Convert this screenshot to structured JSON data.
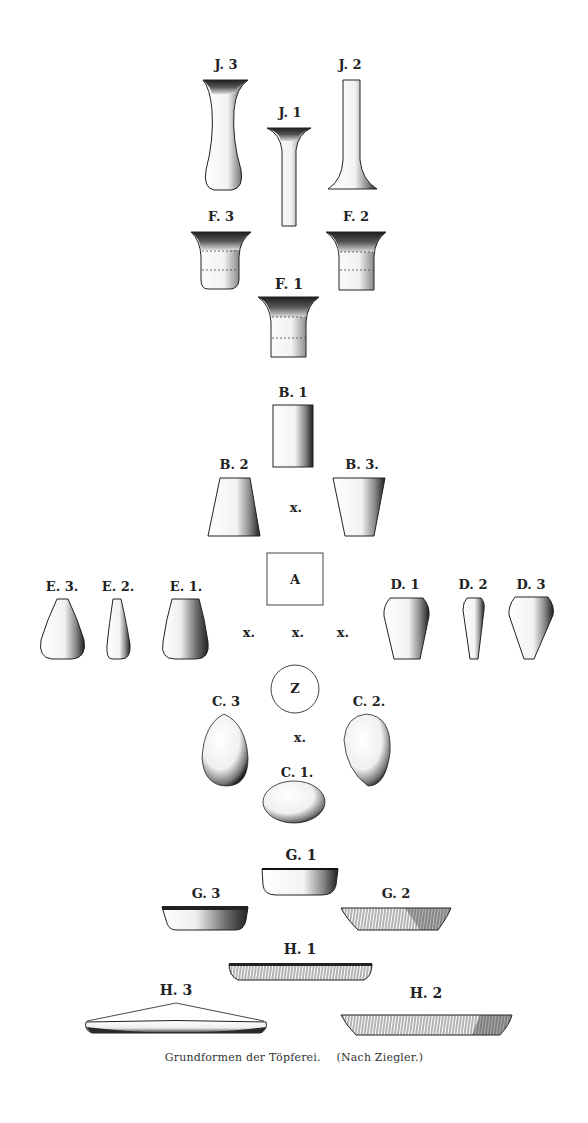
{
  "figure": {
    "caption_title": "Grundformen der Töpferei.",
    "caption_source": "(Nach Ziegler.)",
    "colors": {
      "ink": "#1e1e1e",
      "paper": "#ffffff",
      "shade": "#3a3a3a"
    }
  },
  "labels": {
    "J3": "J. 3",
    "J2": "J. 2",
    "J1": "J. 1",
    "F3": "F. 3",
    "F2": "F. 2",
    "F1": "F. 1",
    "B1": "B. 1",
    "B2": "B. 2",
    "B3": "B. 3.",
    "A": "A",
    "E3": "E. 3.",
    "E2": "E. 2.",
    "E1": "E. 1.",
    "D1": "D. 1",
    "D2": "D. 2",
    "D3": "D. 3",
    "Z": "Z",
    "C3": "C. 3",
    "C2": "C. 2.",
    "C1": "C. 1.",
    "G1": "G. 1",
    "G3": "G. 3",
    "G2": "G. 2",
    "H1": "H. 1",
    "H3": "H. 3",
    "H2": "H. 2"
  },
  "markers": {
    "x_b": "x.",
    "x_left": "x.",
    "x_center": "x.",
    "x_right": "x.",
    "x_c": "x."
  }
}
